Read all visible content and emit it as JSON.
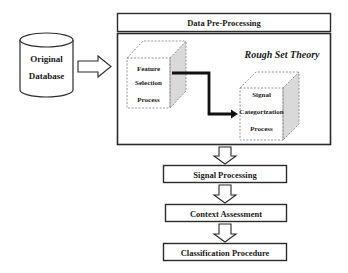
{
  "diagram": {
    "source": {
      "line1": "Original",
      "line2": "Database"
    },
    "preprocessing": {
      "title": "Data Pre-Processing"
    },
    "rough_set": {
      "title": "Rough Set Theory",
      "feature_cube": {
        "line1": "Feature",
        "line2": "Selection",
        "line3": "Process"
      },
      "signal_cube": {
        "line1": "Signal",
        "line2": "Categorization",
        "line3": "Process"
      }
    },
    "steps": [
      {
        "label": "Signal Processing"
      },
      {
        "label": "Context Assessment"
      },
      {
        "label": "Classification Procedure"
      }
    ],
    "colors": {
      "stroke": "#2b2b2b",
      "dashed": "#8a8a8a",
      "side_fill": "#d9d9d9",
      "background": "#ffffff"
    }
  }
}
